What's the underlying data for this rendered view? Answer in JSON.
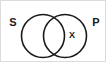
{
  "figure": {
    "name": "venn-diagram",
    "type": "two-set-venn",
    "background_color": "#ffffff",
    "border_color": "#dcdcdc",
    "stroke_color": "#1a1a1a",
    "width": 106,
    "height": 62
  },
  "circles": [
    {
      "id": "left",
      "set_label": "S",
      "cx": 42,
      "cy": 35,
      "r": 21.5
    },
    {
      "id": "right",
      "set_label": "P",
      "cx": 64,
      "cy": 35,
      "r": 21.5
    }
  ],
  "labels": {
    "left_set": "S",
    "right_set": "P",
    "left_set_x": 12,
    "left_set_y": 22,
    "right_set_x": 95,
    "right_set_y": 22
  },
  "markers": [
    {
      "symbol": "X",
      "region": "right-circle-only",
      "x": 71,
      "y": 35
    }
  ]
}
